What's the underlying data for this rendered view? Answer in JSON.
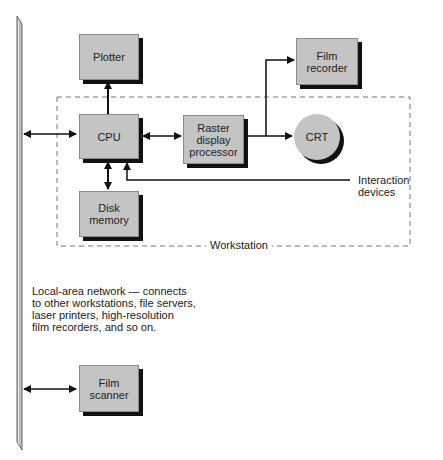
{
  "diagram": {
    "nodes": {
      "plotter": {
        "label": "Plotter"
      },
      "cpu": {
        "label": "CPU"
      },
      "raster": {
        "line1": "Raster",
        "line2": "display",
        "line3": "processor"
      },
      "crt": {
        "label": "CRT"
      },
      "film_recorder": {
        "line1": "Film",
        "line2": "recorder"
      },
      "disk": {
        "line1": "Disk",
        "line2": "memory"
      },
      "film_scanner": {
        "line1": "Film",
        "line2": "scanner"
      }
    },
    "labels": {
      "interaction": {
        "line1": "Interaction",
        "line2": "devices"
      },
      "workstation": "Workstation",
      "network": {
        "line1": "Local-area network — connects",
        "line2": "to other workstations, file servers,",
        "line3": "laser printers, high-resolution",
        "line4": "film recorders, and so on."
      }
    },
    "edges": [
      {
        "from": "network",
        "to": "cpu",
        "type": "bidirectional"
      },
      {
        "from": "cpu",
        "to": "plotter",
        "type": "directed"
      },
      {
        "from": "cpu",
        "to": "raster",
        "type": "bidirectional"
      },
      {
        "from": "raster",
        "to": "crt",
        "type": "directed"
      },
      {
        "from": "raster",
        "to": "film_recorder",
        "type": "directed"
      },
      {
        "from": "cpu",
        "to": "disk",
        "type": "bidirectional"
      },
      {
        "from": "interaction_devices",
        "to": "cpu",
        "type": "directed"
      },
      {
        "from": "network",
        "to": "film_scanner",
        "type": "bidirectional"
      }
    ],
    "colors": {
      "box_fill": "#c4c4c4",
      "shadow": "#111111",
      "line": "#111111",
      "dash": "#777777",
      "network_bar": "#bdbdbd"
    }
  }
}
